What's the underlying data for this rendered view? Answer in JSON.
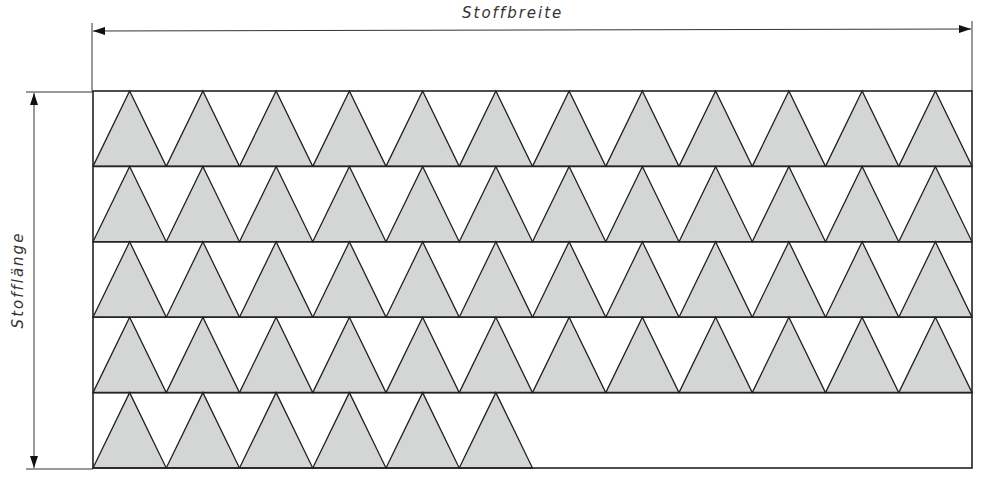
{
  "labels": {
    "width": "Stoffbreite",
    "length": "Stofflänge"
  },
  "colors": {
    "line": "#222222",
    "triangle_fill": "#d4d6d6",
    "background": "#ffffff"
  },
  "layout": {
    "fabric": {
      "x": 93,
      "y": 91,
      "width": 879,
      "height": 377
    },
    "rows": 5,
    "triangles_per_full_row": 12,
    "triangles_in_last_row": 6,
    "triangle_width": 73.25,
    "row_height": 75.4
  },
  "rows": [
    {
      "index": 1,
      "count": 12
    },
    {
      "index": 2,
      "count": 12
    },
    {
      "index": 3,
      "count": 12
    },
    {
      "index": 4,
      "count": 12
    },
    {
      "index": 5,
      "count": 6
    }
  ]
}
